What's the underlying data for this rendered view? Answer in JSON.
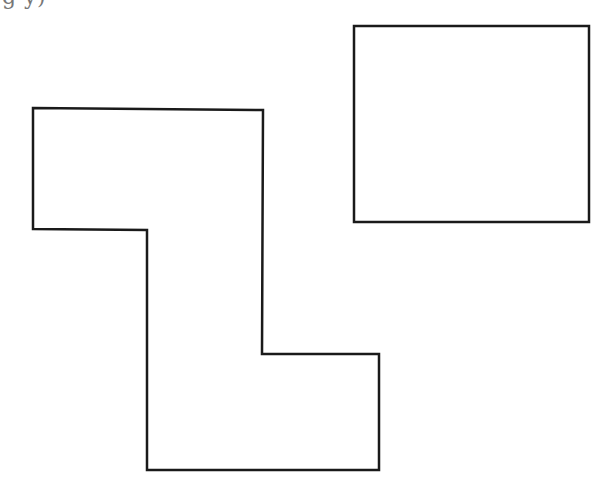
{
  "header": {
    "cutoff_text": "g                                                              y)"
  },
  "diagram": {
    "stroke_color": "#1a1a1a",
    "fill_color": "#ffffff",
    "stroke_width": 2.5,
    "shapes": [
      {
        "name": "z-shaped-polygon",
        "type": "polygon",
        "points": "33,108 263,110 262,354 379,354 379,470 147,470 147,230 33,229"
      },
      {
        "name": "rectangle",
        "type": "rect",
        "x": 354,
        "y": 26,
        "width": 235,
        "height": 196
      }
    ]
  }
}
